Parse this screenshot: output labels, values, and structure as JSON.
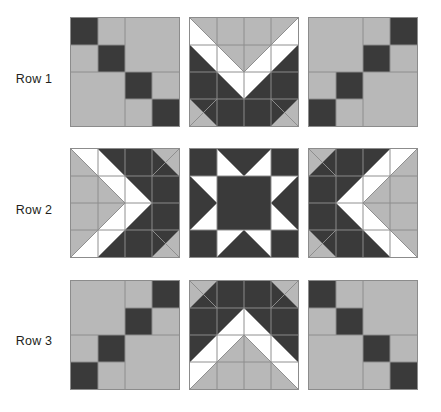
{
  "diagram": {
    "type": "quilt-block-grid",
    "rows": 3,
    "columns": 3
  },
  "palette": {
    "dark": "#3a3a3a",
    "light": "#b8b8b8",
    "white": "#ffffff",
    "seam": "#8c8c8c",
    "background": "#ffffff",
    "label_text": "#231f20"
  },
  "row_labels": [
    {
      "label": "Row 1"
    },
    {
      "label": "Row 2"
    },
    {
      "label": "Row 3"
    }
  ],
  "blocks": [
    {
      "row": 1,
      "column": 1,
      "name": "Nine Patch chain block, diagonal descending",
      "pattern": "diagonal-chain-down",
      "grid": "4x4",
      "cells": [
        [
          "dark",
          "light",
          "light",
          "light"
        ],
        [
          "light",
          "dark",
          "light",
          "light"
        ],
        [
          "light",
          "light",
          "dark",
          "light"
        ],
        [
          "light",
          "light",
          "light",
          "dark"
        ]
      ]
    },
    {
      "row": 1,
      "column": 2,
      "name": "Chevron flying geese block, pointing down",
      "pattern": "chevron-down",
      "grid": "4x4"
    },
    {
      "row": 1,
      "column": 3,
      "name": "Nine Patch chain block, diagonal ascending",
      "pattern": "diagonal-chain-up",
      "grid": "4x4",
      "cells": [
        [
          "light",
          "light",
          "light",
          "dark"
        ],
        [
          "light",
          "light",
          "dark",
          "light"
        ],
        [
          "light",
          "dark",
          "light",
          "light"
        ],
        [
          "dark",
          "light",
          "light",
          "light"
        ]
      ]
    },
    {
      "row": 2,
      "column": 1,
      "name": "Chevron flying geese block, pointing right",
      "pattern": "chevron-right",
      "grid": "4x4"
    },
    {
      "row": 2,
      "column": 2,
      "name": "Sawtooth Star block",
      "pattern": "sawtooth-star",
      "grid": "4x4"
    },
    {
      "row": 2,
      "column": 3,
      "name": "Chevron flying geese block, pointing left",
      "pattern": "chevron-left",
      "grid": "4x4"
    },
    {
      "row": 3,
      "column": 1,
      "name": "Nine Patch chain block, diagonal ascending",
      "pattern": "diagonal-chain-up",
      "grid": "4x4",
      "cells": [
        [
          "light",
          "light",
          "light",
          "dark"
        ],
        [
          "light",
          "light",
          "dark",
          "light"
        ],
        [
          "light",
          "dark",
          "light",
          "light"
        ],
        [
          "dark",
          "light",
          "light",
          "light"
        ]
      ]
    },
    {
      "row": 3,
      "column": 2,
      "name": "Chevron flying geese block, pointing up",
      "pattern": "chevron-up",
      "grid": "4x4"
    },
    {
      "row": 3,
      "column": 3,
      "name": "Nine Patch chain block, diagonal descending",
      "pattern": "diagonal-chain-down",
      "grid": "4x4",
      "cells": [
        [
          "dark",
          "light",
          "light",
          "light"
        ],
        [
          "light",
          "dark",
          "light",
          "light"
        ],
        [
          "light",
          "light",
          "dark",
          "light"
        ],
        [
          "light",
          "light",
          "light",
          "dark"
        ]
      ]
    }
  ]
}
